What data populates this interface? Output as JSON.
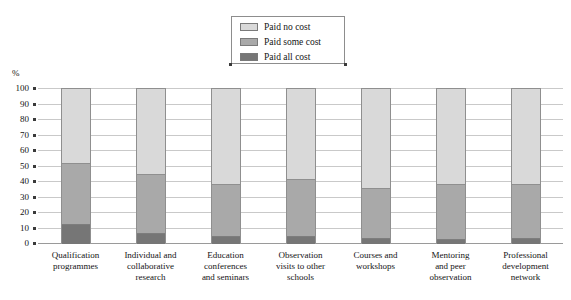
{
  "axis": {
    "y_unit_label": "%",
    "y_ticks": [
      "100",
      "90",
      "80",
      "70",
      "60",
      "50",
      "40",
      "30",
      "20",
      "10",
      "0"
    ]
  },
  "legend": {
    "items": [
      {
        "label": "Paid no cost",
        "color": "#d9d9d9"
      },
      {
        "label": "Paid some cost",
        "color": "#a9a9a9"
      },
      {
        "label": "Paid all cost",
        "color": "#767676"
      }
    ]
  },
  "chart_data": {
    "type": "bar",
    "title": "",
    "xlabel": "",
    "ylabel": "%",
    "ylim": [
      0,
      100
    ],
    "grid": true,
    "stacked": true,
    "legend_position": "top-center",
    "categories": [
      "Qualification programmes",
      "Individual and collaborative research",
      "Education conferences and seminars",
      "Observation visits to other schools",
      "Courses and workshops",
      "Mentoring and peer observation",
      "Professional development network"
    ],
    "category_lines": [
      [
        "Qualification",
        "programmes"
      ],
      [
        "Individual and",
        "collaborative",
        "research"
      ],
      [
        "Education",
        "conferences",
        "and seminars"
      ],
      [
        "Observation",
        "visits to other",
        "schools"
      ],
      [
        "Courses and",
        "workshops"
      ],
      [
        "Mentoring",
        "and peer",
        "observation"
      ],
      [
        "Professional",
        "development",
        "network"
      ]
    ],
    "series": [
      {
        "name": "Paid no cost",
        "color": "#d9d9d9",
        "values": [
          48,
          55,
          61,
          58,
          64,
          61,
          61
        ]
      },
      {
        "name": "Paid some cost",
        "color": "#a9a9a9",
        "values": [
          39,
          38,
          34,
          37,
          32,
          36,
          35
        ]
      },
      {
        "name": "Paid all cost",
        "color": "#767676",
        "values": [
          13,
          7,
          5,
          5,
          4,
          3,
          4
        ]
      }
    ],
    "cumulative_tops": {
      "Paid all cost": [
        13,
        7,
        5,
        5,
        4,
        3,
        4
      ],
      "Paid some cost": [
        52,
        45,
        39,
        42,
        36,
        39,
        39
      ],
      "Paid no cost": [
        100,
        100,
        100,
        100,
        100,
        100,
        100
      ]
    }
  }
}
